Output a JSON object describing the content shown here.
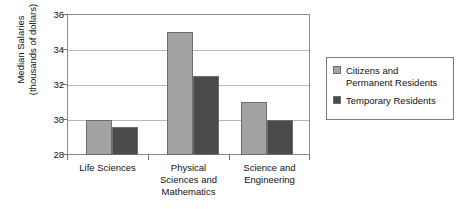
{
  "chart_data": {
    "type": "bar",
    "title": "",
    "xlabel": "",
    "ylabel": "Median Salaries\n(thousands of dollars)",
    "ylim": [
      28,
      36
    ],
    "yticks": [
      28,
      30,
      32,
      34,
      36
    ],
    "grid": true,
    "legend_position": "right",
    "categories": [
      "Life Sciences",
      "Physical\nSciences and\nMathematics",
      "Science and\nEngineering"
    ],
    "series": [
      {
        "name": "Citizens and\nPermanent Residents",
        "color": "#a3a3a3",
        "values": [
          30,
          35,
          31
        ]
      },
      {
        "name": "Temporary Residents",
        "color": "#4a4a4a",
        "values": [
          29.6,
          32.5,
          30
        ]
      }
    ]
  },
  "axis": {
    "y_tick_labels": [
      "28",
      "30",
      "32",
      "34",
      "36"
    ]
  }
}
